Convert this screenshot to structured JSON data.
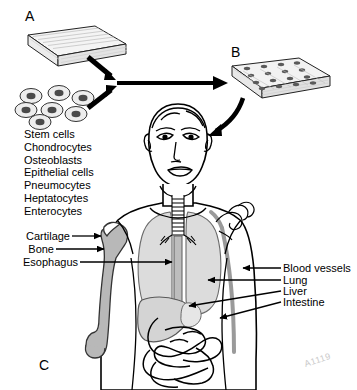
{
  "figure": {
    "panels": [
      {
        "id": "A",
        "letter": "A",
        "meaning": "unseeded-scaffold"
      },
      {
        "id": "B",
        "letter": "B",
        "meaning": "cell-seeded-scaffold"
      },
      {
        "id": "C",
        "letter": "C",
        "meaning": "implantation-body"
      }
    ],
    "cell_types": [
      "Stem cells",
      "Chondrocytes",
      "Osteoblasts",
      "Epithelial cells",
      "Pneumocytes",
      "Heptatocytes",
      "Enterocytes"
    ],
    "left_labels": [
      {
        "text": "Cartilage",
        "target": "femoral-head-cartilage"
      },
      {
        "text": "Bone",
        "target": "femur"
      },
      {
        "text": "Esophagus",
        "target": "esophagus"
      }
    ],
    "right_labels": [
      {
        "text": "Blood vessels",
        "target": "blood-vessels"
      },
      {
        "text": "Lung",
        "target": "lung"
      },
      {
        "text": "Liver",
        "target": "liver"
      },
      {
        "text": "Intestine",
        "target": "intestine"
      }
    ],
    "watermark": "A1119",
    "colors": {
      "ink": "#000000",
      "organ_fill": "#d8d8d8",
      "organ_fill_light": "#e2e2e2",
      "bone_fill": "#b5b5b5",
      "vessel_fill": "#a8a8a8",
      "scaffold_fill": "#f2f2f2",
      "cell_ring": "#e8e8e8",
      "cell_nucleus": "#4a4a4a",
      "watermark": "#c9c9c9",
      "background": "#ffffff"
    }
  }
}
